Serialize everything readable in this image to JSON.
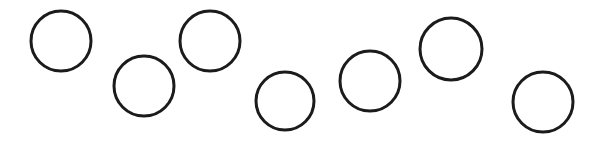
{
  "image": {
    "title": "Hand-drawn circles row",
    "width": 600,
    "height": 141,
    "background_color": "#ffffff",
    "stroke_color": "#1b1b1b",
    "stroke_width": 3,
    "shape_kind": "circle-outline",
    "shape_count": 7,
    "caption": ""
  },
  "chart_data": {
    "type": "scatter",
    "title": "",
    "subtitle": "",
    "xlabel": "",
    "ylabel": "",
    "grid": false,
    "legend": null,
    "xlim": [
      0,
      600
    ],
    "ylim": [
      0,
      141
    ],
    "marker": "open-circle",
    "series": [
      {
        "name": "circles",
        "stroke": "#1b1b1b",
        "stroke_width": 3,
        "fill": "none",
        "points": [
          {
            "label": "circle-1",
            "cx": 61,
            "cy": 41,
            "r": 30
          },
          {
            "label": "circle-2",
            "cx": 144,
            "cy": 86,
            "r": 30
          },
          {
            "label": "circle-3",
            "cx": 210,
            "cy": 41,
            "r": 30
          },
          {
            "label": "circle-4",
            "cx": 285,
            "cy": 101,
            "r": 29
          },
          {
            "label": "circle-5",
            "cx": 370,
            "cy": 81,
            "r": 30
          },
          {
            "label": "circle-6",
            "cx": 451,
            "cy": 49,
            "r": 31
          },
          {
            "label": "circle-7",
            "cx": 543,
            "cy": 102,
            "r": 30
          }
        ]
      }
    ]
  }
}
